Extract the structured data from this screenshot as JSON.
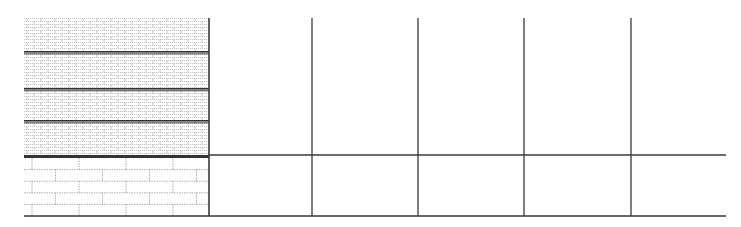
{
  "drawing": {
    "type": "elevation-grid",
    "colors": {
      "line": "#3a3a3a",
      "hatch": "#8a8a8a",
      "brick_joint": "#9a9a9a",
      "band": "#333333"
    },
    "upper_hatch_panel": {
      "x": 24,
      "y": 18,
      "width": 185,
      "height": 137,
      "bands_y": [
        51,
        88,
        120
      ]
    },
    "lower_brick_panel": {
      "x": 24,
      "y": 158,
      "width": 185,
      "height": 58,
      "rows": 5,
      "brick_width": 47
    },
    "vertical_lines_x": [
      209,
      312,
      418,
      524,
      631
    ],
    "horizontal_lines_y": [
      155,
      216
    ],
    "grid_top_y": 18,
    "grid_right_x": 726
  }
}
